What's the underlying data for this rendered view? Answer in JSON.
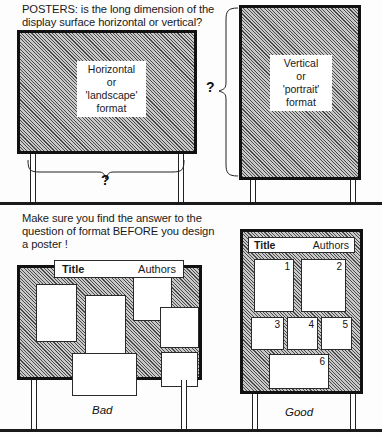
{
  "figure": {
    "top_section": {
      "caption": "POSTERS: is the long dimension of the\ndisplay surface horizontal or vertical?",
      "horizontal_board": {
        "label_lines": [
          "Horizontal",
          "or",
          "'landscape'",
          "format"
        ],
        "brace_question": "?"
      },
      "vertical_board": {
        "label_lines": [
          "Vertical",
          "or",
          "'portrait'",
          "format"
        ],
        "brace_question": "?"
      }
    },
    "bottom_section": {
      "caption": "Make sure you find the answer to the\nquestion of format BEFORE you design\na poster !",
      "bad_board": {
        "verdict": "Bad",
        "title": "Title",
        "authors": "Authors",
        "panels": [
          "",
          "",
          "",
          "",
          "",
          ""
        ]
      },
      "good_board": {
        "verdict": "Good",
        "title": "Title",
        "authors": "Authors",
        "panels": [
          "1",
          "2",
          "3",
          "4",
          "5",
          "6"
        ]
      }
    }
  },
  "colors": {
    "ink": "#111111",
    "board_fill": "#c9c9c9",
    "paper": "#ffffff",
    "page": "#fdfdfd"
  }
}
